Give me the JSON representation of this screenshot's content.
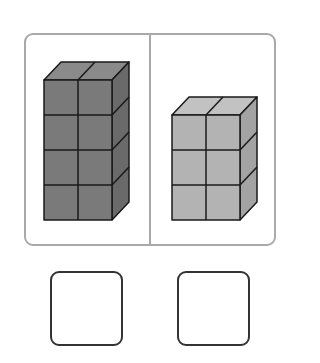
{
  "figure": {
    "panels": [
      {
        "id": "left",
        "cubes_wide": 2,
        "cubes_tall": 4,
        "fill_front": "#7a7a7a",
        "fill_top": "#8a8a8a",
        "fill_side": "#6a6a6a"
      },
      {
        "id": "right",
        "cubes_wide": 2,
        "cubes_tall": 3,
        "fill_front": "#b3b3b3",
        "fill_top": "#c2c2c2",
        "fill_side": "#a3a3a3"
      }
    ],
    "frame_color": "#a9a9a9",
    "edge_color": "#1a1a1a"
  },
  "answer_boxes": [
    {
      "id": "answer-left",
      "value": ""
    },
    {
      "id": "answer-right",
      "value": ""
    }
  ]
}
